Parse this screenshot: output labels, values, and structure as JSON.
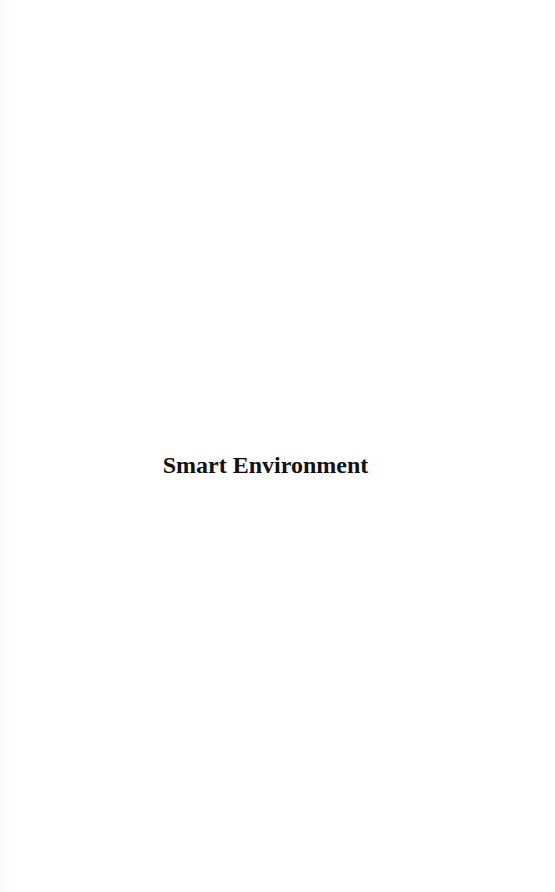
{
  "page": {
    "title": "Smart Environment"
  },
  "colors": {
    "background": "#ffffff",
    "text": "#111111"
  }
}
